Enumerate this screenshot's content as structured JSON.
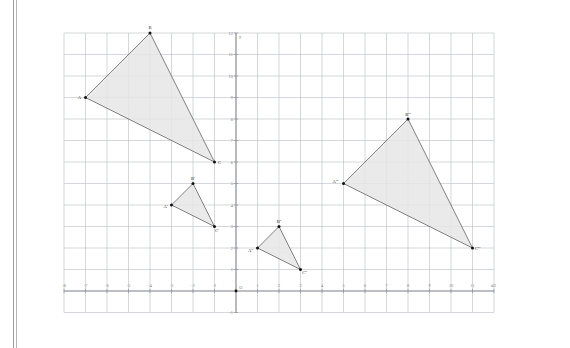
{
  "figure": {
    "type": "coordinate-plane-diagram",
    "background": "#ffffff",
    "grid_color": "#b9bcc4",
    "axis_color": "#8e9199",
    "triangle_fill": "#e6e6e6",
    "triangle_stroke": "#5a5a5a",
    "vertex_color": "#111111",
    "border_color": "#8d8d8d"
  },
  "axes": {
    "x_axis_label": "x",
    "y_axis_label": "y",
    "origin_label": "O",
    "x_ticks": [
      "-8",
      "-7",
      "-6",
      "-5",
      "-4",
      "-3",
      "-2",
      "-1",
      "0",
      "1",
      "2",
      "3",
      "4",
      "5",
      "6",
      "7",
      "8",
      "9",
      "10",
      "11",
      "12"
    ],
    "y_ticks": [
      "12",
      "11",
      "10",
      "9",
      "8",
      "7",
      "6",
      "5",
      "4",
      "3",
      "2",
      "1",
      "0",
      "-1"
    ],
    "x_min": -8,
    "x_max": 12,
    "y_min": -1,
    "y_max": 12,
    "grid_step": 1
  },
  "chart_data": {
    "type": "scatter",
    "title": "",
    "xlabel": "x",
    "ylabel": "y",
    "xlim": [
      -8,
      12
    ],
    "ylim": [
      -1,
      12
    ],
    "grid": true,
    "legend": "none",
    "series": [
      {
        "name": "Triangle ABC",
        "points": [
          {
            "label": "A",
            "x": -7,
            "y": 9
          },
          {
            "label": "B",
            "x": -4,
            "y": 12
          },
          {
            "label": "C",
            "x": -1,
            "y": 6
          }
        ]
      },
      {
        "name": "Triangle A'B'C'",
        "points": [
          {
            "label": "A'",
            "x": -3,
            "y": 4
          },
          {
            "label": "B'",
            "x": -2,
            "y": 5
          },
          {
            "label": "C'",
            "x": -1,
            "y": 3
          }
        ]
      },
      {
        "name": "Triangle A''B''C''",
        "points": [
          {
            "label": "A''",
            "x": 1,
            "y": 2
          },
          {
            "label": "B''",
            "x": 2,
            "y": 3
          },
          {
            "label": "C''",
            "x": 3,
            "y": 1
          }
        ]
      },
      {
        "name": "Triangle A'''B'''C'''",
        "points": [
          {
            "label": "A'''",
            "x": 5,
            "y": 5
          },
          {
            "label": "B'''",
            "x": 8,
            "y": 8
          },
          {
            "label": "C'''",
            "x": 11,
            "y": 2
          }
        ]
      }
    ]
  }
}
